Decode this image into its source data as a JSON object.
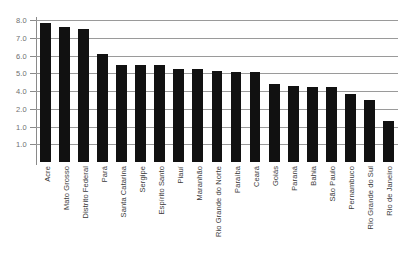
{
  "chart_data": {
    "type": "bar",
    "title": "",
    "subtitle": "",
    "xlabel": "",
    "ylabel": "",
    "ylim": [
      0,
      8.0
    ],
    "grid": true,
    "legend": false,
    "legend_position": "none",
    "bar_color": "#111111",
    "gridline_color": "#9a9a9a",
    "background_color": "#ffffff",
    "axis_label_color": "#6f6f6f",
    "y_ticks": [
      "8.0",
      "7.0",
      "6.0",
      "5.0",
      "4.0",
      "2.0",
      "1.0"
    ],
    "y_tick_values": [
      8.0,
      7.0,
      6.0,
      5.0,
      4.0,
      3.0,
      2.0,
      1.0
    ],
    "categories": [
      "Acre",
      "Mato Grosso",
      "Distrito Federal",
      "Pará",
      "Santa Catarina",
      "Sergipe",
      "Espírito Santo",
      "Piauí",
      "Maranhão",
      "Rio Grande do Norte",
      "Paraíba",
      "Ceará",
      "Goiás",
      "Paraná",
      "Bahia",
      "São Paulo",
      "Pernambuco",
      "Rio Grande do Sul",
      "Rio de Janeiro"
    ],
    "values": [
      7.85,
      7.6,
      7.5,
      6.1,
      5.45,
      5.45,
      5.45,
      5.25,
      5.25,
      5.1,
      5.05,
      5.05,
      4.4,
      4.3,
      4.2,
      4.2,
      3.85,
      3.5,
      2.3
    ]
  }
}
